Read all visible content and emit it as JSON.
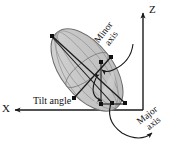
{
  "figure": {
    "background_color": "#ffffff",
    "stroke_color": "#1a1a1a",
    "ellipsoid_fill": "#c9c9c9",
    "ellipsoid_fill_light": "#dcdcdc",
    "ellipsoid_stroke": "#707070"
  },
  "axes": {
    "z": {
      "label": "Z",
      "direction": "up"
    },
    "x": {
      "label": "X",
      "direction": "left"
    }
  },
  "annotations": {
    "minor_axis": {
      "line1": "Minor",
      "line2": "axis"
    },
    "major_axis": {
      "line1": "Major",
      "line2": "axis"
    },
    "tilt_angle": "Tilt angle"
  }
}
